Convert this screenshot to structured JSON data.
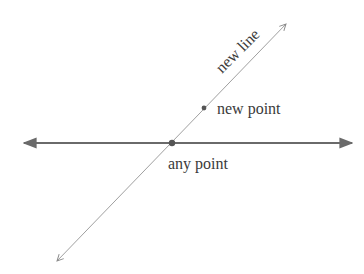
{
  "diagram": {
    "labels": {
      "new_line": "new line",
      "new_point": "new point",
      "any_point": "any point"
    },
    "colors": {
      "horizontal_line": "#6a6a6a",
      "diagonal_line": "#9a9a9a",
      "points": "#555555",
      "text": "#3a3a3a"
    },
    "elements": {
      "horizontal_line": {
        "x1": 24,
        "y1": 143,
        "x2": 352,
        "y2": 143
      },
      "diagonal_line": {
        "x1": 57,
        "y1": 261,
        "x2": 286,
        "y2": 24
      },
      "any_point": {
        "cx": 172,
        "cy": 143
      },
      "new_point": {
        "cx": 204,
        "cy": 108
      }
    }
  }
}
